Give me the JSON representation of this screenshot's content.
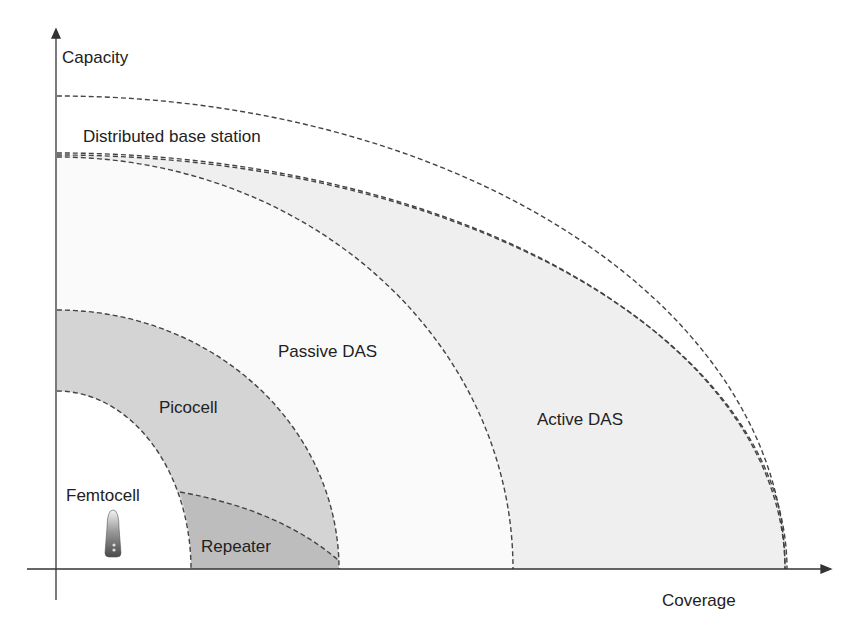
{
  "diagram": {
    "type": "capacity-vs-coverage",
    "axes": {
      "y_label": "Capacity",
      "x_label": "Coverage"
    },
    "regions": [
      {
        "id": "femtocell",
        "label": "Femtocell",
        "fill": "#ffffff"
      },
      {
        "id": "picocell",
        "label": "Picocell",
        "fill": "#d6d6d6"
      },
      {
        "id": "repeater",
        "label": "Repeater",
        "fill": "#bfbfbf"
      },
      {
        "id": "passive-das",
        "label": "Passive DAS",
        "fill": "#ffffff"
      },
      {
        "id": "active-das",
        "label": "Active DAS",
        "fill": "#efefef"
      },
      {
        "id": "distributed-base-station",
        "label": "Distributed base station",
        "fill": "#ffffff"
      }
    ],
    "icon": {
      "name": "femtocell-device-icon"
    },
    "colors": {
      "axis": "#333333",
      "dash": "#444444",
      "text": "#222222"
    }
  }
}
